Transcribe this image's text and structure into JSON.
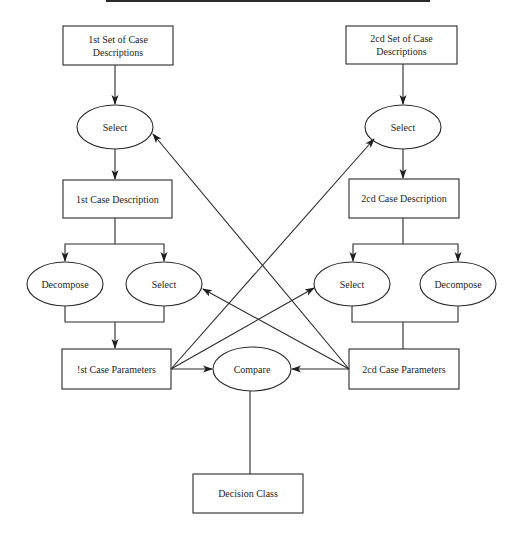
{
  "diagram": {
    "colors": {
      "stroke": "#2a2a2a",
      "background": "#ffffff",
      "text": "#1e1e1e"
    },
    "top_rule": {
      "x1": 106,
      "x2": 430,
      "y": 1
    },
    "nodes": {
      "set1": {
        "label": "1st Set of Case Descriptions",
        "line1": "1st Set of Case",
        "line2": "Descriptions",
        "shape": "rect"
      },
      "set2": {
        "label": "2cd Set of Case Descriptions",
        "line1": "2cd Set of Case",
        "line2": "Descriptions",
        "shape": "rect"
      },
      "select1": {
        "label": "Select",
        "shape": "ellipse"
      },
      "select2": {
        "label": "Select",
        "shape": "ellipse"
      },
      "case1": {
        "label": "1st Case Description",
        "shape": "rect"
      },
      "case2": {
        "label": "2cd Case Description",
        "shape": "rect"
      },
      "decompose1": {
        "label": "Decompose",
        "shape": "ellipse"
      },
      "select1b": {
        "label": "Select",
        "shape": "ellipse"
      },
      "select2b": {
        "label": "Select",
        "shape": "ellipse"
      },
      "decompose2": {
        "label": "Decompose",
        "shape": "ellipse"
      },
      "params1": {
        "label": "!st Case Parameters",
        "shape": "rect"
      },
      "params2": {
        "label": "2cd Case Parameters",
        "shape": "rect"
      },
      "compare": {
        "label": "Compare",
        "shape": "ellipse"
      },
      "decision": {
        "label": "Decision Class",
        "shape": "rect"
      }
    },
    "edges": [
      {
        "from": "set1",
        "to": "select1",
        "arrow": true
      },
      {
        "from": "select1",
        "to": "case1",
        "arrow": true
      },
      {
        "from": "case1",
        "to": "decompose1",
        "arrow": true
      },
      {
        "from": "case1",
        "to": "select1b",
        "arrow": true
      },
      {
        "from": "decompose1+select1b",
        "to": "params1",
        "arrow": true
      },
      {
        "from": "set2",
        "to": "select2",
        "arrow": true
      },
      {
        "from": "select2",
        "to": "case2",
        "arrow": true
      },
      {
        "from": "case2",
        "to": "select2b",
        "arrow": true
      },
      {
        "from": "case2",
        "to": "decompose2",
        "arrow": true
      },
      {
        "from": "select2b+decompose2",
        "to": "params2",
        "arrow": false
      },
      {
        "from": "params1",
        "to": "select2",
        "arrow": true
      },
      {
        "from": "params1",
        "to": "select2b",
        "arrow": true
      },
      {
        "from": "params1",
        "to": "compare",
        "arrow": true
      },
      {
        "from": "params2",
        "to": "select1",
        "arrow": true
      },
      {
        "from": "params2",
        "to": "select1b",
        "arrow": true
      },
      {
        "from": "params2",
        "to": "compare",
        "arrow": true
      },
      {
        "from": "compare",
        "to": "decision",
        "arrow": false
      }
    ]
  }
}
